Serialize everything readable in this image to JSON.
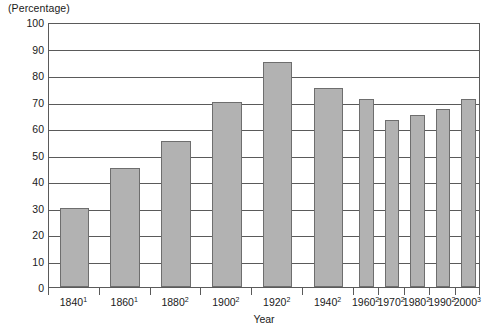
{
  "chart_data": {
    "type": "bar",
    "title": "",
    "subtitle": "",
    "unit_caption": "(Percentage)",
    "xlabel": "Year",
    "ylabel": "",
    "ylim": [
      0,
      100
    ],
    "ytick_step": 10,
    "grid": true,
    "legend": "none",
    "bar_color": "#b2b2b2",
    "bar_border_color": "#6e6e6e",
    "axis_color": "#5a5a5a",
    "categories": [
      "1840¹",
      "1860¹",
      "1880²",
      "1900²",
      "1920²",
      "1940²",
      "1960²",
      "1970²",
      "1980²",
      "1990²",
      "2000³"
    ],
    "category_labels": [
      {
        "year": "1840",
        "note": "1"
      },
      {
        "year": "1860",
        "note": "1"
      },
      {
        "year": "1880",
        "note": "2"
      },
      {
        "year": "1900",
        "note": "2"
      },
      {
        "year": "1920",
        "note": "2"
      },
      {
        "year": "1940",
        "note": "2"
      },
      {
        "year": "1960",
        "note": "2"
      },
      {
        "year": "1970",
        "note": "2"
      },
      {
        "year": "1980",
        "note": "2"
      },
      {
        "year": "1990",
        "note": "2"
      },
      {
        "year": "2000",
        "note": "3"
      }
    ],
    "values": [
      30,
      45,
      55,
      70,
      85,
      75,
      71,
      63,
      65,
      67,
      71
    ],
    "ytick_labels": [
      "100",
      "90",
      "80",
      "70",
      "60",
      "50",
      "40",
      "30",
      "20",
      "10",
      "0"
    ],
    "ytick_values": [
      100,
      90,
      80,
      70,
      60,
      50,
      40,
      30,
      20,
      10,
      0
    ]
  }
}
